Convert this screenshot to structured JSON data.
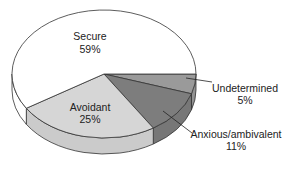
{
  "chart_data": {
    "type": "pie",
    "style": "3d",
    "title": "",
    "slices": [
      {
        "name": "Undetermined",
        "label": "Undetermined",
        "pct_label": "5%",
        "value": 5,
        "color": "#9a9a9a"
      },
      {
        "name": "Anxious/ambivalent",
        "label": "Anxious/ambivalent",
        "pct_label": "11%",
        "value": 11,
        "color": "#7d7d7d"
      },
      {
        "name": "Avoidant",
        "label": "Avoidant",
        "pct_label": "25%",
        "value": 25,
        "color": "#d6d6d6"
      },
      {
        "name": "Secure",
        "label": "Secure",
        "pct_label": "59%",
        "value": 59,
        "color": "#ffffff"
      }
    ],
    "start_angle": "right (3 o'clock), clockwise",
    "legend": "none (callout labels)"
  }
}
